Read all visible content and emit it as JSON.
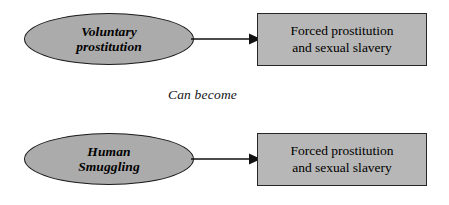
{
  "diagram": {
    "caption": "Can become",
    "colors": {
      "ellipse_fill": "#ababab",
      "rect_fill": "#b7b7b7",
      "stroke": "#1b1b1b",
      "background": "#ffffff",
      "text": "#000000"
    },
    "rows": [
      {
        "source": {
          "shape": "ellipse",
          "line1": "Voluntary",
          "line2": "prostitution"
        },
        "connector": {
          "type": "arrow",
          "direction": "right"
        },
        "target": {
          "shape": "rectangle",
          "line1": "Forced prostitution",
          "line2": "and sexual slavery"
        }
      },
      {
        "source": {
          "shape": "ellipse",
          "line1": "Human",
          "line2": "Smuggling"
        },
        "connector": {
          "type": "arrow",
          "direction": "right"
        },
        "target": {
          "shape": "rectangle",
          "line1": "Forced prostitution",
          "line2": "and sexual slavery"
        }
      }
    ]
  }
}
